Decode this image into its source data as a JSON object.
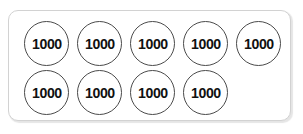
{
  "figure": {
    "kind": "place-value-counters",
    "card": {
      "border_color": "#d2d2d2",
      "background": "#ffffff"
    },
    "counter": {
      "value_label": "1000",
      "stroke_color": "#4a4a4a",
      "fill_color": "#ffffff",
      "text_color": "#111111"
    },
    "total_counters": 9,
    "rows": [
      {
        "name": "top-row",
        "count": 5,
        "counters": [
          {
            "label": "1000",
            "x": 15
          },
          {
            "label": "1000",
            "x": 68
          },
          {
            "label": "1000",
            "x": 121
          },
          {
            "label": "1000",
            "x": 174
          },
          {
            "label": "1000",
            "x": 227
          }
        ]
      },
      {
        "name": "bottom-row",
        "count": 4,
        "counters": [
          {
            "label": "1000",
            "x": 15
          },
          {
            "label": "1000",
            "x": 68
          },
          {
            "label": "1000",
            "x": 121
          },
          {
            "label": "1000",
            "x": 174
          }
        ]
      }
    ]
  }
}
